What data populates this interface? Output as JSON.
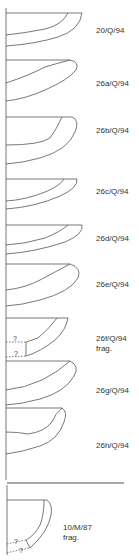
{
  "figure": {
    "type": "pottery-profile-drawings",
    "line_color": "#555555",
    "profiles": [
      {
        "id": "20/Q/94",
        "note": ""
      },
      {
        "id": "26a/Q/94",
        "note": ""
      },
      {
        "id": "26b/Q/94",
        "note": ""
      },
      {
        "id": "26c/Q/94",
        "note": ""
      },
      {
        "id": "26d/Q/94",
        "note": ""
      },
      {
        "id": "26e/Q/94",
        "note": ""
      },
      {
        "id": "26f/Q/94",
        "note": "frag.",
        "uncertain_marks": [
          "?",
          "?"
        ]
      },
      {
        "id": "26g/Q/94",
        "note": ""
      },
      {
        "id": "26h/Q/94",
        "note": ""
      },
      {
        "id": "10/M/87",
        "note": "frag.",
        "uncertain_marks": [
          "?",
          "?"
        ]
      }
    ]
  }
}
